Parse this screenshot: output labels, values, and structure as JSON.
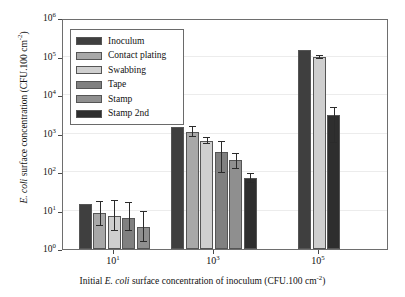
{
  "chart_data": {
    "type": "bar",
    "title": "",
    "xlabel": "Initial E. coli surface concentration of inoculum (CFU.100 cm-2)",
    "ylabel": "E. coli surface concentration (CFU.100 cm-2)",
    "yscale": "log",
    "ylim": [
      1,
      1000000
    ],
    "grid": true,
    "legend_position": "upper-left inside",
    "categories": [
      "10^1",
      "10^3",
      "10^5"
    ],
    "category_labels": [
      "10",
      "10",
      "10"
    ],
    "category_exponents": [
      "1",
      "3",
      "5"
    ],
    "ytick_labels": [
      "10",
      "10",
      "10",
      "10",
      "10",
      "10",
      "10"
    ],
    "ytick_exponents": [
      "0",
      "1",
      "2",
      "3",
      "4",
      "5",
      "6"
    ],
    "ytick_values": [
      1,
      10,
      100,
      1000,
      10000,
      100000,
      1000000
    ],
    "series": [
      {
        "name": "Inoculum",
        "color": "#3f3f3f",
        "values": [
          15,
          1500,
          150000
        ],
        "err_low": [
          null,
          null,
          null
        ],
        "err_high": [
          null,
          null,
          null
        ]
      },
      {
        "name": "Contact plating",
        "color": "#a8a8a8",
        "values": [
          8.5,
          1100,
          null
        ],
        "err_low": [
          4,
          800,
          null
        ],
        "err_high": [
          17,
          1450,
          null
        ]
      },
      {
        "name": "Swabbing",
        "color": "#cfcfcf",
        "values": [
          7,
          650,
          95000
        ],
        "err_low": [
          3,
          520,
          88000
        ],
        "err_high": [
          18,
          780,
          103000
        ]
      },
      {
        "name": "Tape",
        "color": "#808080",
        "values": [
          6.3,
          330,
          null
        ],
        "err_low": [
          3,
          95,
          null
        ],
        "err_high": [
          16,
          620,
          null
        ]
      },
      {
        "name": "Stamp",
        "color": "#8f8f8f",
        "values": [
          3.7,
          210,
          null
        ],
        "err_low": [
          1.5,
          120,
          null
        ],
        "err_high": [
          9,
          300,
          null
        ]
      },
      {
        "name": "Stamp 2nd",
        "color": "#2e2e2e",
        "values": [
          null,
          68,
          3100
        ],
        "err_low": [
          null,
          52,
          560
        ],
        "err_high": [
          null,
          88,
          4600
        ]
      }
    ]
  },
  "legend": {
    "items": [
      {
        "label": "Inoculum"
      },
      {
        "label": "Contact plating"
      },
      {
        "label": "Swabbing"
      },
      {
        "label": "Tape"
      },
      {
        "label": "Stamp"
      },
      {
        "label": "Stamp 2nd"
      }
    ]
  },
  "axes": {
    "y_title_prefix": "E. coli",
    "y_title_rest": " surface concentration (CFU.100 cm",
    "y_title_sup": "-2",
    "y_title_suffix": ")",
    "x_title_prefix": "Initial ",
    "x_title_italic": "E. coli",
    "x_title_rest": " surface concentration of inoculum (CFU.100 cm",
    "x_title_sup": "-2",
    "x_title_suffix": ")"
  }
}
